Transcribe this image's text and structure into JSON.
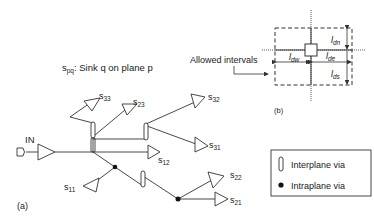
{
  "figure": {
    "panel_a_label": "(a)",
    "panel_b_label": "(b)",
    "legend_title": {
      "s": "s",
      "sub": "pq",
      "rest": ": Sink q on plane p"
    },
    "input_label": "IN",
    "sinks": [
      {
        "id": "s33",
        "base": "s",
        "sub": "33"
      },
      {
        "id": "s23",
        "base": "s",
        "sub": "23"
      },
      {
        "id": "s32",
        "base": "s",
        "sub": "32"
      },
      {
        "id": "s31",
        "base": "s",
        "sub": "31"
      },
      {
        "id": "s12",
        "base": "s",
        "sub": "12"
      },
      {
        "id": "s11",
        "base": "s",
        "sub": "11"
      },
      {
        "id": "s22",
        "base": "s",
        "sub": "22"
      },
      {
        "id": "s21",
        "base": "s",
        "sub": "21"
      }
    ],
    "panel_b": {
      "allowed_intervals_label": "Allowed intervals",
      "intervals": [
        {
          "id": "dn",
          "base": "l",
          "sub": "dn"
        },
        {
          "id": "dw",
          "base": "l",
          "sub": "dw"
        },
        {
          "id": "de",
          "base": "l",
          "sub": "de"
        },
        {
          "id": "ds",
          "base": "l",
          "sub": "ds"
        }
      ]
    },
    "legend": {
      "interplane_via": "Interplane via",
      "intraplane_via": "Intraplane via"
    },
    "colors": {
      "stroke": "#333333",
      "background": "#ffffff"
    }
  }
}
